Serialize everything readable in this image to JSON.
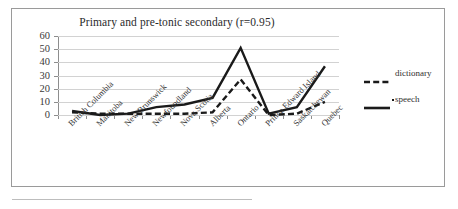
{
  "chart_data": {
    "type": "line",
    "title": "Primary and pre-tonic secondary (r=0.95)",
    "xlabel": "",
    "ylabel": "",
    "ylim": [
      0,
      60
    ],
    "yticks": [
      0,
      10,
      20,
      30,
      40,
      50,
      60
    ],
    "grid": true,
    "legend_position": "right",
    "categories": [
      "British Columbia",
      "Manitoba",
      "New Brunswick",
      "Newfoundland",
      "Nova Scotia",
      "Alberta",
      "Ontario",
      "Prince Edward Island",
      "Saskatchewan",
      "Quebec"
    ],
    "series": [
      {
        "name": "dictionary",
        "style": "dashed",
        "color": "#1a1a1a",
        "values": [
          2,
          1,
          1,
          1,
          1,
          2,
          27,
          0,
          1,
          10
        ]
      },
      {
        "name": "speech",
        "style": "solid",
        "color": "#1a1a1a",
        "values": [
          3,
          0,
          1,
          6,
          8,
          13,
          51,
          1,
          6,
          37
        ]
      }
    ]
  },
  "legend": {
    "items": [
      {
        "label": "dictionary",
        "key": "dashed-line-key"
      },
      {
        "label": "speech",
        "key": "solid-line-key"
      }
    ]
  },
  "axes": {
    "y_tick_labels": [
      "60",
      "50",
      "40",
      "30",
      "20",
      "10",
      "0"
    ]
  }
}
